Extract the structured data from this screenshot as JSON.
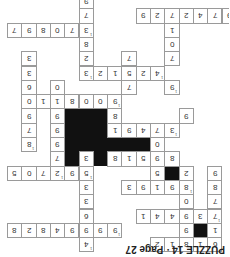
{
  "title": "PUZZLE 14 · Page 27",
  "cells": [
    {
      "c": 5,
      "r": 0,
      "v": "9"
    },
    {
      "c": 5,
      "r": 1,
      "v": "7"
    },
    {
      "c": 9,
      "r": 1,
      "v": "9"
    },
    {
      "c": 10,
      "r": 1,
      "v": "2"
    },
    {
      "c": 11,
      "r": 1,
      "v": "7"
    },
    {
      "c": 12,
      "r": 1,
      "v": "2"
    },
    {
      "c": 13,
      "r": 1,
      "v": "4"
    },
    {
      "c": 14,
      "r": 1,
      "v": "7"
    },
    {
      "c": 15,
      "r": 1,
      "v": "9",
      "n": "1"
    },
    {
      "c": 0,
      "r": 2,
      "v": "7"
    },
    {
      "c": 1,
      "r": 2,
      "v": "9"
    },
    {
      "c": 2,
      "r": 2,
      "v": "8"
    },
    {
      "c": 3,
      "r": 2,
      "v": "0"
    },
    {
      "c": 4,
      "r": 2,
      "v": "7"
    },
    {
      "c": 5,
      "r": 2,
      "v": "3",
      "n": "1"
    },
    {
      "c": 11,
      "r": 2,
      "v": "1"
    },
    {
      "c": 5,
      "r": 3,
      "v": "8"
    },
    {
      "c": 11,
      "r": 3,
      "v": "0"
    },
    {
      "c": 1,
      "r": 4,
      "v": "3"
    },
    {
      "c": 5,
      "r": 4,
      "v": "2"
    },
    {
      "c": 8,
      "r": 4,
      "v": "7"
    },
    {
      "c": 11,
      "r": 4,
      "v": "7"
    },
    {
      "c": 1,
      "r": 5,
      "v": "3"
    },
    {
      "c": 5,
      "r": 5,
      "v": "3",
      "n": "1"
    },
    {
      "c": 6,
      "r": 5,
      "v": "2"
    },
    {
      "c": 7,
      "r": 5,
      "v": "1"
    },
    {
      "c": 8,
      "r": 5,
      "v": "5"
    },
    {
      "c": 9,
      "r": 5,
      "v": "2"
    },
    {
      "c": 10,
      "r": 5,
      "v": "4",
      "n": "1"
    },
    {
      "c": 1,
      "r": 6,
      "v": "6"
    },
    {
      "c": 3,
      "r": 6,
      "v": "0"
    },
    {
      "c": 8,
      "r": 6,
      "v": "7"
    },
    {
      "c": 11,
      "r": 6,
      "v": "9",
      "n": "1"
    },
    {
      "c": 1,
      "r": 7,
      "v": "0"
    },
    {
      "c": 2,
      "r": 7,
      "v": "1"
    },
    {
      "c": 3,
      "r": 7,
      "v": "1"
    },
    {
      "c": 4,
      "r": 7,
      "v": "8"
    },
    {
      "c": 5,
      "r": 7,
      "v": "0"
    },
    {
      "c": 6,
      "r": 7,
      "v": "0"
    },
    {
      "c": 7,
      "r": 7,
      "v": "9",
      "n": "1"
    },
    {
      "c": 1,
      "r": 8,
      "v": "9"
    },
    {
      "c": 3,
      "r": 8,
      "v": "9"
    },
    {
      "c": 7,
      "r": 8,
      "v": "8"
    },
    {
      "c": 12,
      "r": 8,
      "v": "9"
    },
    {
      "c": 1,
      "r": 9,
      "v": "7"
    },
    {
      "c": 3,
      "r": 9,
      "v": "9"
    },
    {
      "c": 7,
      "r": 9,
      "v": "1"
    },
    {
      "c": 8,
      "r": 9,
      "v": "9"
    },
    {
      "c": 9,
      "r": 9,
      "v": "4"
    },
    {
      "c": 10,
      "r": 9,
      "v": "7"
    },
    {
      "c": 11,
      "r": 9,
      "v": "3",
      "n": "1"
    },
    {
      "c": 1,
      "r": 10,
      "v": "8",
      "n": "1"
    },
    {
      "c": 3,
      "r": 10,
      "v": "9"
    },
    {
      "c": 10,
      "r": 10,
      "v": "0"
    },
    {
      "c": 3,
      "r": 11,
      "v": "7"
    },
    {
      "c": 5,
      "r": 11,
      "v": "3"
    },
    {
      "c": 7,
      "r": 11,
      "v": "8"
    },
    {
      "c": 8,
      "r": 11,
      "v": "1"
    },
    {
      "c": 9,
      "r": 11,
      "v": "5"
    },
    {
      "c": 10,
      "r": 11,
      "v": "9"
    },
    {
      "c": 11,
      "r": 11,
      "v": "8"
    },
    {
      "c": 0,
      "r": 12,
      "v": "5"
    },
    {
      "c": 1,
      "r": 12,
      "v": "0"
    },
    {
      "c": 2,
      "r": 12,
      "v": "7"
    },
    {
      "c": 3,
      "r": 12,
      "v": "2",
      "n": "1"
    },
    {
      "c": 4,
      "r": 12,
      "v": "9"
    },
    {
      "c": 5,
      "r": 12,
      "v": "5",
      "n": "1"
    },
    {
      "c": 10,
      "r": 12,
      "v": "5"
    },
    {
      "c": 12,
      "r": 12,
      "v": "2"
    },
    {
      "c": 14,
      "r": 12,
      "v": "9"
    },
    {
      "c": 5,
      "r": 13,
      "v": "3"
    },
    {
      "c": 8,
      "r": 13,
      "v": "3"
    },
    {
      "c": 9,
      "r": 13,
      "v": "9"
    },
    {
      "c": 10,
      "r": 13,
      "v": "1"
    },
    {
      "c": 11,
      "r": 13,
      "v": "9"
    },
    {
      "c": 12,
      "r": 13,
      "v": "8",
      "n": "1"
    },
    {
      "c": 14,
      "r": 13,
      "v": "8"
    },
    {
      "c": 5,
      "r": 14,
      "v": "3"
    },
    {
      "c": 12,
      "r": 14,
      "v": "0"
    },
    {
      "c": 14,
      "r": 14,
      "v": "7"
    },
    {
      "c": 5,
      "r": 15,
      "v": "6"
    },
    {
      "c": 9,
      "r": 15,
      "v": "1"
    },
    {
      "c": 10,
      "r": 15,
      "v": "4"
    },
    {
      "c": 11,
      "r": 15,
      "v": "4"
    },
    {
      "c": 12,
      "r": 15,
      "v": "9"
    },
    {
      "c": 13,
      "r": 15,
      "v": "3"
    },
    {
      "c": 14,
      "r": 15,
      "v": "7",
      "n": "1"
    },
    {
      "c": 0,
      "r": 16,
      "v": "8"
    },
    {
      "c": 1,
      "r": 16,
      "v": "2"
    },
    {
      "c": 2,
      "r": 16,
      "v": "8"
    },
    {
      "c": 3,
      "r": 16,
      "v": "4"
    },
    {
      "c": 4,
      "r": 16,
      "v": "9"
    },
    {
      "c": 5,
      "r": 16,
      "v": "9"
    },
    {
      "c": 6,
      "r": 16,
      "v": "9"
    },
    {
      "c": 7,
      "r": 16,
      "v": "9",
      "n": "1"
    },
    {
      "c": 12,
      "r": 16,
      "v": "9"
    },
    {
      "c": 14,
      "r": 16,
      "v": "1"
    },
    {
      "c": 5,
      "r": 17,
      "v": "4",
      "n": "1"
    },
    {
      "c": 10,
      "r": 17,
      "v": "2"
    },
    {
      "c": 11,
      "r": 17,
      "v": "1"
    },
    {
      "c": 12,
      "r": 17,
      "v": "8",
      "n": "1"
    },
    {
      "c": 13,
      "r": 17,
      "v": "1"
    },
    {
      "c": 14,
      "r": 17,
      "v": "6"
    }
  ],
  "blocks": [
    {
      "c": 4,
      "r": 8,
      "w": 3,
      "h": 4
    },
    {
      "c": 7,
      "r": 10,
      "w": 3,
      "h": 1
    },
    {
      "c": 11,
      "r": 12,
      "w": 1,
      "h": 1
    },
    {
      "c": 13,
      "r": 16,
      "w": 1,
      "h": 1
    }
  ]
}
